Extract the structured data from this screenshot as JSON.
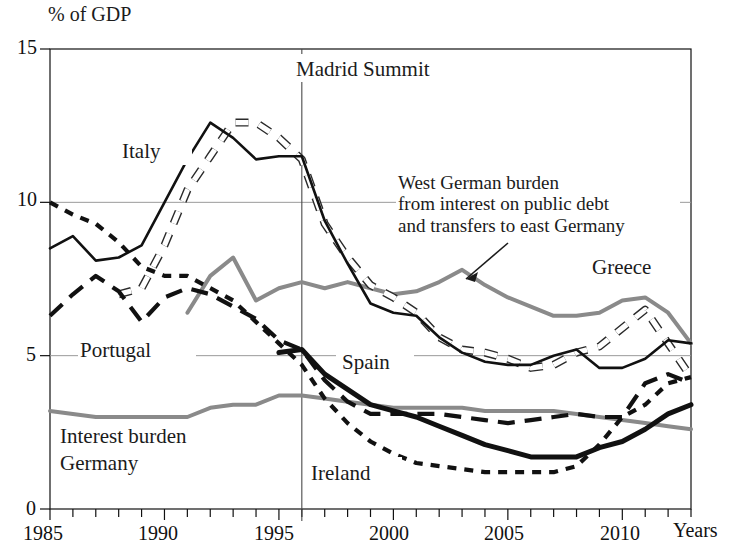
{
  "figure": {
    "y_axis_unit": "% of GDP",
    "x_axis_title": "Years",
    "y_ticks": [
      "15",
      "10",
      "5",
      "0"
    ],
    "x_ticks": [
      "1985",
      "1990",
      "1995",
      "2000",
      "2005",
      "2010"
    ],
    "event_marker": "Madrid Summit",
    "annotation": {
      "line1": "West German burden",
      "line2": "from interest on public debt",
      "line3": "and transfers to east Germany"
    },
    "series_labels": {
      "italy": "Italy",
      "portugal": "Portugal",
      "spain": "Spain",
      "ireland": "Ireland",
      "greece": "Greece",
      "germany": "Interest burden\nGermany",
      "germany_l1": "Interest burden",
      "germany_l2": "Germany"
    },
    "colors": {
      "ink": "#111111",
      "gray": "#8a8a8a",
      "grid": "#9a9a9a",
      "paper": "#ffffff"
    }
  },
  "chart_data": {
    "type": "line",
    "title": "",
    "xlabel": "Years",
    "ylabel": "% of GDP",
    "xlim": [
      1985,
      2013
    ],
    "ylim": [
      0,
      15
    ],
    "yticks": [
      0,
      5,
      10,
      15
    ],
    "xticks": [
      1985,
      1990,
      1995,
      2000,
      2005,
      2010
    ],
    "grid": "horizontal gridlines at 5 and 10; vertical event line at 1996 (Madrid Summit)",
    "legend": "inline labels next to curves",
    "annotations": [
      {
        "text": "Madrid Summit",
        "x": 1996,
        "note": "vertical rule"
      },
      {
        "text": "West German burden from interest on public debt and transfers to east Germany",
        "x": 2003,
        "y": 7.8,
        "note": "arrow points to grey upper curve"
      }
    ],
    "series": [
      {
        "name": "Italy",
        "style": "thin solid black",
        "x": [
          1985,
          1986,
          1987,
          1988,
          1989,
          1990,
          1991,
          1992,
          1993,
          1994,
          1995,
          1996,
          1997,
          1998,
          1999,
          2000,
          2001,
          2002,
          2003,
          2004,
          2005,
          2006,
          2007,
          2008,
          2009,
          2010,
          2011,
          2012,
          2013
        ],
        "values": [
          8.5,
          8.9,
          8.1,
          8.2,
          8.6,
          10.0,
          11.4,
          12.6,
          12.1,
          11.4,
          11.5,
          11.5,
          9.4,
          8.0,
          6.7,
          6.4,
          6.3,
          5.6,
          5.1,
          4.8,
          4.7,
          4.7,
          5.0,
          5.2,
          4.6,
          4.6,
          4.9,
          5.5,
          5.4
        ]
      },
      {
        "name": "Greece",
        "style": "white outlined dashed",
        "x": [
          1988,
          1989,
          1990,
          1991,
          1992,
          1993,
          1994,
          1995,
          1996,
          1997,
          1998,
          1999,
          2000,
          2001,
          2002,
          2003,
          2004,
          2005,
          2006,
          2007,
          2008,
          2009,
          2010,
          2011,
          2012,
          2013
        ],
        "values": [
          7.0,
          7.2,
          8.6,
          10.4,
          11.5,
          12.6,
          12.6,
          12.1,
          11.4,
          9.3,
          8.2,
          7.3,
          6.9,
          6.4,
          5.6,
          5.2,
          5.1,
          4.9,
          4.6,
          4.7,
          5.1,
          5.3,
          5.9,
          6.5,
          5.4,
          4.3
        ]
      },
      {
        "name": "West German burden from interest on public debt and transfers to east Germany",
        "style": "grey solid upper",
        "x": [
          1991,
          1992,
          1993,
          1994,
          1995,
          1996,
          1997,
          1998,
          1999,
          2000,
          2001,
          2002,
          2003,
          2004,
          2005,
          2006,
          2007,
          2008,
          2009,
          2010,
          2011,
          2012,
          2013
        ],
        "values": [
          6.4,
          7.6,
          8.2,
          6.8,
          7.2,
          7.4,
          7.2,
          7.4,
          7.2,
          7.0,
          7.1,
          7.4,
          7.8,
          7.3,
          6.9,
          6.6,
          6.3,
          6.3,
          6.4,
          6.8,
          6.9,
          6.4,
          5.4
        ]
      },
      {
        "name": "Portugal",
        "style": "long dashed black",
        "x": [
          1985,
          1986,
          1987,
          1988,
          1989,
          1990,
          1991,
          1992,
          1993,
          1994,
          1995,
          1996,
          1997,
          1998,
          1999,
          2000,
          2001,
          2002,
          2003,
          2004,
          2005,
          2006,
          2007,
          2008,
          2009,
          2010,
          2011,
          2012,
          2013
        ],
        "values": [
          6.3,
          7.0,
          7.6,
          7.1,
          6.1,
          6.9,
          7.2,
          7.0,
          6.6,
          6.2,
          5.5,
          5.2,
          4.2,
          3.5,
          3.1,
          3.1,
          3.1,
          3.1,
          3.0,
          2.9,
          2.8,
          2.9,
          3.0,
          3.1,
          3.0,
          3.0,
          4.1,
          4.4,
          4.1
        ]
      },
      {
        "name": "Ireland",
        "style": "short dashed black",
        "x": [
          1985,
          1986,
          1987,
          1988,
          1989,
          1990,
          1991,
          1992,
          1993,
          1994,
          1995,
          1996,
          1997,
          1998,
          1999,
          2000,
          2001,
          2002,
          2003,
          2004,
          2005,
          2006,
          2007,
          2008,
          2009,
          2010,
          2011,
          2012,
          2013
        ],
        "values": [
          10.0,
          9.6,
          9.3,
          8.7,
          7.9,
          7.6,
          7.6,
          7.2,
          6.8,
          6.1,
          5.4,
          4.7,
          3.6,
          2.8,
          2.2,
          1.8,
          1.5,
          1.4,
          1.3,
          1.2,
          1.2,
          1.2,
          1.2,
          1.4,
          2.1,
          3.0,
          3.4,
          4.1,
          4.3
        ]
      },
      {
        "name": "Spain",
        "style": "thick solid black",
        "x": [
          1995,
          1996,
          1997,
          1998,
          1999,
          2000,
          2001,
          2002,
          2003,
          2004,
          2005,
          2006,
          2007,
          2008,
          2009,
          2010,
          2011,
          2012,
          2013
        ],
        "values": [
          5.1,
          5.2,
          4.4,
          3.9,
          3.4,
          3.2,
          3.0,
          2.7,
          2.4,
          2.1,
          1.9,
          1.7,
          1.7,
          1.7,
          2.0,
          2.2,
          2.6,
          3.1,
          3.4
        ]
      },
      {
        "name": "Interest burden Germany",
        "style": "grey solid lower",
        "x": [
          1985,
          1986,
          1987,
          1988,
          1989,
          1990,
          1991,
          1992,
          1993,
          1994,
          1995,
          1996,
          1997,
          1998,
          1999,
          2000,
          2001,
          2002,
          2003,
          2004,
          2005,
          2006,
          2007,
          2008,
          2009,
          2010,
          2011,
          2012,
          2013
        ],
        "values": [
          3.2,
          3.1,
          3.0,
          3.0,
          3.0,
          3.0,
          3.0,
          3.3,
          3.4,
          3.4,
          3.7,
          3.7,
          3.6,
          3.5,
          3.4,
          3.3,
          3.3,
          3.3,
          3.3,
          3.2,
          3.2,
          3.2,
          3.2,
          3.1,
          3.0,
          2.9,
          2.8,
          2.7,
          2.6
        ]
      }
    ]
  }
}
